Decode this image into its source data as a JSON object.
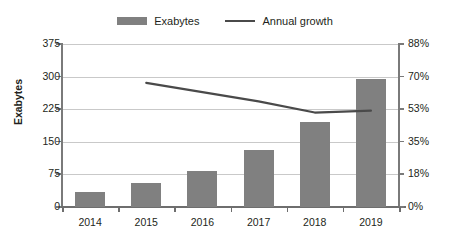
{
  "legend": {
    "items": [
      {
        "label": "Exabytes",
        "type": "bar",
        "color": "#808080",
        "icon": "bar-swatch-icon"
      },
      {
        "label": "Annual growth",
        "type": "line",
        "color": "#4a4a4a",
        "icon": "line-swatch-icon"
      }
    ]
  },
  "axes": {
    "y_left_title": "Exabytes",
    "y_left_ticks": [
      "0",
      "75",
      "150",
      "225",
      "300",
      "375"
    ],
    "y_right_ticks": [
      "0%",
      "18%",
      "35%",
      "53%",
      "70%",
      "88%"
    ],
    "x_ticks": [
      "2014",
      "2015",
      "2016",
      "2017",
      "2018",
      "2019"
    ]
  },
  "chart_data": {
    "type": "bar",
    "title": "",
    "xlabel": "",
    "ylabel": "Exabytes",
    "categories": [
      "2014",
      "2015",
      "2016",
      "2017",
      "2018",
      "2019"
    ],
    "series": [
      {
        "name": "Exabytes",
        "type": "bar",
        "axis": "left",
        "color": "#808080",
        "values": [
          35,
          55,
          82,
          130,
          195,
          295
        ]
      },
      {
        "name": "Annual growth",
        "type": "line",
        "axis": "right",
        "color": "#4a4a4a",
        "values": [
          null,
          67,
          62,
          57,
          51,
          52
        ],
        "unit": "%"
      }
    ],
    "ylim": [
      0,
      375
    ],
    "y2lim": [
      0,
      88
    ],
    "yticks": [
      0,
      75,
      150,
      225,
      300,
      375
    ],
    "y2ticks": [
      0,
      18,
      35,
      53,
      70,
      88
    ],
    "grid": true,
    "legend_position": "top-center"
  }
}
